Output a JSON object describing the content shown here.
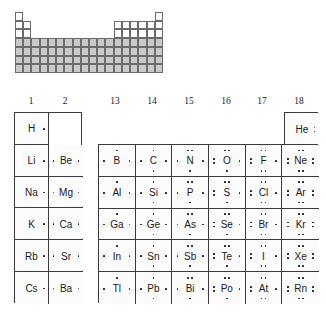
{
  "figure": {
    "kind": "lewis-dot-periodic-table",
    "mini_table": {
      "rows": 7,
      "columns": 18,
      "shaded_color": "#c9c9c9",
      "unshaded_color": "#ffffff",
      "border_color": "#6b6b6b",
      "note": "full periodic table outline with main-group columns shaded"
    },
    "group_labels": [
      "1",
      "2",
      "13",
      "14",
      "15",
      "16",
      "17",
      "18"
    ],
    "main_table": {
      "columns": [
        "1",
        "2",
        "13",
        "14",
        "15",
        "16",
        "17",
        "18"
      ],
      "rows": [
        {
          "period": "1",
          "cells": [
            {
              "symbol": "H",
              "group": "1",
              "valence": 1,
              "dots": {
                "top": 0,
                "bottom": 0,
                "left": 0,
                "right": 1
              }
            },
            {
              "symbol": "",
              "group": "2",
              "valence": 0,
              "dots": {
                "top": 0,
                "bottom": 0,
                "left": 0,
                "right": 0
              }
            },
            {
              "symbol": "",
              "group": "13",
              "valence": 0,
              "dots": {
                "top": 0,
                "bottom": 0,
                "left": 0,
                "right": 0
              }
            },
            {
              "symbol": "",
              "group": "14",
              "valence": 0,
              "dots": {
                "top": 0,
                "bottom": 0,
                "left": 0,
                "right": 0
              }
            },
            {
              "symbol": "",
              "group": "15",
              "valence": 0,
              "dots": {
                "top": 0,
                "bottom": 0,
                "left": 0,
                "right": 0
              }
            },
            {
              "symbol": "",
              "group": "16",
              "valence": 0,
              "dots": {
                "top": 0,
                "bottom": 0,
                "left": 0,
                "right": 0
              }
            },
            {
              "symbol": "",
              "group": "17",
              "valence": 0,
              "dots": {
                "top": 0,
                "bottom": 0,
                "left": 0,
                "right": 0
              }
            },
            {
              "symbol": "He",
              "group": "18",
              "valence": 2,
              "dots": {
                "top": 0,
                "bottom": 0,
                "left": 0,
                "right": 2
              }
            }
          ]
        },
        {
          "period": "2",
          "cells": [
            {
              "symbol": "Li",
              "group": "1",
              "valence": 1,
              "dots": {
                "top": 0,
                "bottom": 0,
                "left": 0,
                "right": 1
              }
            },
            {
              "symbol": "Be",
              "group": "2",
              "valence": 2,
              "dots": {
                "top": 0,
                "bottom": 0,
                "left": 1,
                "right": 1
              }
            },
            {
              "symbol": "B",
              "group": "13",
              "valence": 3,
              "dots": {
                "top": 1,
                "bottom": 0,
                "left": 1,
                "right": 1
              }
            },
            {
              "symbol": "C",
              "group": "14",
              "valence": 4,
              "dots": {
                "top": 1,
                "bottom": 1,
                "left": 1,
                "right": 1
              }
            },
            {
              "symbol": "N",
              "group": "15",
              "valence": 5,
              "dots": {
                "top": 2,
                "bottom": 1,
                "left": 1,
                "right": 1
              }
            },
            {
              "symbol": "O",
              "group": "16",
              "valence": 6,
              "dots": {
                "top": 2,
                "bottom": 1,
                "left": 2,
                "right": 1
              }
            },
            {
              "symbol": "F",
              "group": "17",
              "valence": 7,
              "dots": {
                "top": 2,
                "bottom": 2,
                "left": 2,
                "right": 1
              }
            },
            {
              "symbol": "Ne",
              "group": "18",
              "valence": 8,
              "dots": {
                "top": 2,
                "bottom": 2,
                "left": 2,
                "right": 2
              }
            }
          ]
        },
        {
          "period": "3",
          "cells": [
            {
              "symbol": "Na",
              "group": "1",
              "valence": 1,
              "dots": {
                "top": 0,
                "bottom": 0,
                "left": 0,
                "right": 1
              }
            },
            {
              "symbol": "Mg",
              "group": "2",
              "valence": 2,
              "dots": {
                "top": 0,
                "bottom": 0,
                "left": 1,
                "right": 1
              }
            },
            {
              "symbol": "Al",
              "group": "13",
              "valence": 3,
              "dots": {
                "top": 1,
                "bottom": 0,
                "left": 1,
                "right": 1
              }
            },
            {
              "symbol": "Si",
              "group": "14",
              "valence": 4,
              "dots": {
                "top": 1,
                "bottom": 1,
                "left": 1,
                "right": 1
              }
            },
            {
              "symbol": "P",
              "group": "15",
              "valence": 5,
              "dots": {
                "top": 2,
                "bottom": 1,
                "left": 1,
                "right": 1
              }
            },
            {
              "symbol": "S",
              "group": "16",
              "valence": 6,
              "dots": {
                "top": 2,
                "bottom": 1,
                "left": 2,
                "right": 1
              }
            },
            {
              "symbol": "Cl",
              "group": "17",
              "valence": 7,
              "dots": {
                "top": 2,
                "bottom": 2,
                "left": 2,
                "right": 1
              }
            },
            {
              "symbol": "Ar",
              "group": "18",
              "valence": 8,
              "dots": {
                "top": 2,
                "bottom": 2,
                "left": 2,
                "right": 2
              }
            }
          ]
        },
        {
          "period": "4",
          "cells": [
            {
              "symbol": "K",
              "group": "1",
              "valence": 1,
              "dots": {
                "top": 0,
                "bottom": 0,
                "left": 0,
                "right": 1
              }
            },
            {
              "symbol": "Ca",
              "group": "2",
              "valence": 2,
              "dots": {
                "top": 0,
                "bottom": 0,
                "left": 1,
                "right": 1
              }
            },
            {
              "symbol": "Ga",
              "group": "13",
              "valence": 3,
              "dots": {
                "top": 1,
                "bottom": 0,
                "left": 1,
                "right": 1
              }
            },
            {
              "symbol": "Ge",
              "group": "14",
              "valence": 4,
              "dots": {
                "top": 1,
                "bottom": 1,
                "left": 1,
                "right": 1
              }
            },
            {
              "symbol": "As",
              "group": "15",
              "valence": 5,
              "dots": {
                "top": 2,
                "bottom": 1,
                "left": 1,
                "right": 1
              }
            },
            {
              "symbol": "Se",
              "group": "16",
              "valence": 6,
              "dots": {
                "top": 2,
                "bottom": 1,
                "left": 2,
                "right": 1
              }
            },
            {
              "symbol": "Br",
              "group": "17",
              "valence": 7,
              "dots": {
                "top": 2,
                "bottom": 2,
                "left": 2,
                "right": 1
              }
            },
            {
              "symbol": "Kr",
              "group": "18",
              "valence": 8,
              "dots": {
                "top": 2,
                "bottom": 2,
                "left": 2,
                "right": 2
              }
            }
          ]
        },
        {
          "period": "5",
          "cells": [
            {
              "symbol": "Rb",
              "group": "1",
              "valence": 1,
              "dots": {
                "top": 0,
                "bottom": 0,
                "left": 0,
                "right": 1
              }
            },
            {
              "symbol": "Sr",
              "group": "2",
              "valence": 2,
              "dots": {
                "top": 0,
                "bottom": 0,
                "left": 1,
                "right": 1
              }
            },
            {
              "symbol": "In",
              "group": "13",
              "valence": 3,
              "dots": {
                "top": 1,
                "bottom": 0,
                "left": 1,
                "right": 1
              }
            },
            {
              "symbol": "Sn",
              "group": "14",
              "valence": 4,
              "dots": {
                "top": 1,
                "bottom": 1,
                "left": 1,
                "right": 1
              }
            },
            {
              "symbol": "Sb",
              "group": "15",
              "valence": 5,
              "dots": {
                "top": 2,
                "bottom": 1,
                "left": 1,
                "right": 1
              }
            },
            {
              "symbol": "Te",
              "group": "16",
              "valence": 6,
              "dots": {
                "top": 2,
                "bottom": 1,
                "left": 2,
                "right": 1
              }
            },
            {
              "symbol": "I",
              "group": "17",
              "valence": 7,
              "dots": {
                "top": 2,
                "bottom": 2,
                "left": 2,
                "right": 1
              }
            },
            {
              "symbol": "Xe",
              "group": "18",
              "valence": 8,
              "dots": {
                "top": 2,
                "bottom": 2,
                "left": 2,
                "right": 2
              }
            }
          ]
        },
        {
          "period": "6",
          "cells": [
            {
              "symbol": "Cs",
              "group": "1",
              "valence": 1,
              "dots": {
                "top": 0,
                "bottom": 0,
                "left": 0,
                "right": 1
              }
            },
            {
              "symbol": "Ba",
              "group": "2",
              "valence": 2,
              "dots": {
                "top": 0,
                "bottom": 0,
                "left": 1,
                "right": 1
              }
            },
            {
              "symbol": "Tl",
              "group": "13",
              "valence": 3,
              "dots": {
                "top": 1,
                "bottom": 0,
                "left": 1,
                "right": 1
              }
            },
            {
              "symbol": "Pb",
              "group": "14",
              "valence": 4,
              "dots": {
                "top": 1,
                "bottom": 1,
                "left": 1,
                "right": 1
              }
            },
            {
              "symbol": "Bi",
              "group": "15",
              "valence": 5,
              "dots": {
                "top": 2,
                "bottom": 1,
                "left": 1,
                "right": 1
              }
            },
            {
              "symbol": "Po",
              "group": "16",
              "valence": 6,
              "dots": {
                "top": 2,
                "bottom": 1,
                "left": 2,
                "right": 1
              }
            },
            {
              "symbol": "At",
              "group": "17",
              "valence": 7,
              "dots": {
                "top": 2,
                "bottom": 2,
                "left": 2,
                "right": 1
              }
            },
            {
              "symbol": "Rn",
              "group": "18",
              "valence": 8,
              "dots": {
                "top": 2,
                "bottom": 2,
                "left": 2,
                "right": 2
              }
            }
          ]
        }
      ]
    }
  }
}
